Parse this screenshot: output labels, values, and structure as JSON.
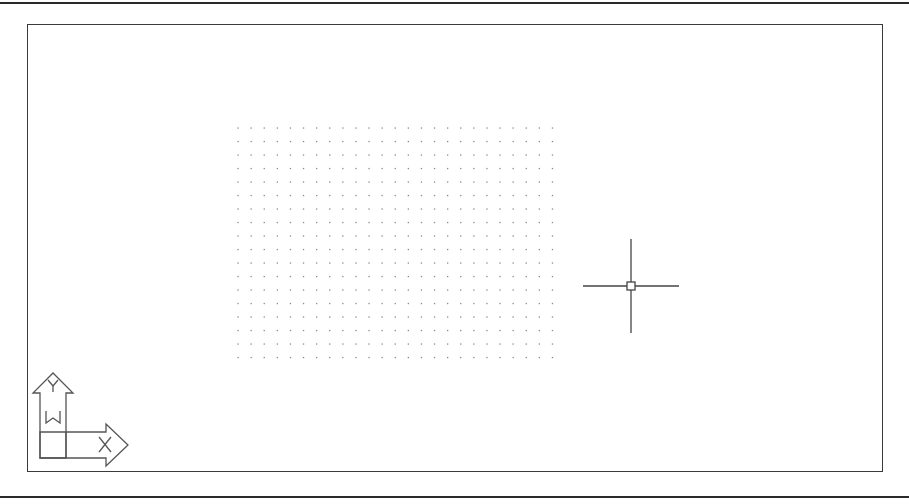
{
  "drawing_area": {
    "background": "#ffffff",
    "frame_color": "#3a3a3a",
    "grid": {
      "visible": true,
      "dot_color": "#8a8a8a",
      "origin_x": 238,
      "origin_y": 128,
      "spacing_x": 13.1,
      "spacing_y": 13.5,
      "columns": 25,
      "rows": 18
    },
    "crosshair": {
      "x": 631,
      "y": 286,
      "half_length_h": 48,
      "half_length_v": 47,
      "pickbox_size": 8,
      "color": "#444444"
    },
    "ucs_icon": {
      "x_label": "X",
      "y_label": "Y",
      "world_label": "W",
      "color": "#555555"
    }
  }
}
